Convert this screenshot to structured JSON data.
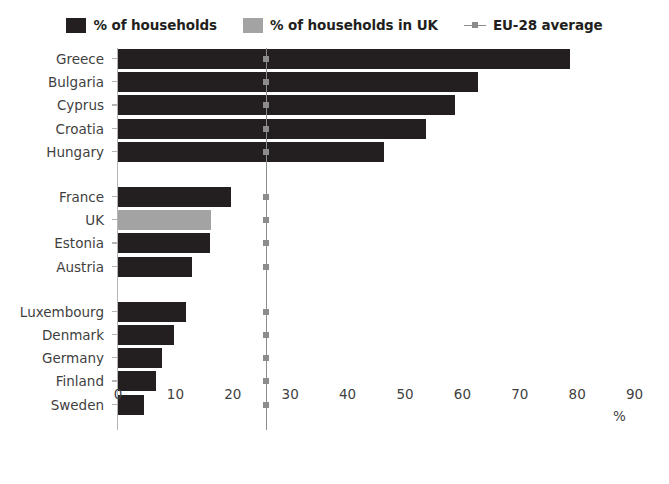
{
  "legend": {
    "items": [
      {
        "label": "% of households",
        "type": "swatch",
        "color": "#231f20",
        "icon": "square-swatch-icon"
      },
      {
        "label": "% of households in UK",
        "type": "swatch",
        "color": "#a3a3a3",
        "icon": "square-swatch-icon"
      },
      {
        "label": "EU-28 average",
        "type": "line",
        "color": "#8c8c8c",
        "icon": "line-marker-icon"
      }
    ]
  },
  "axis": {
    "x_unit": "%",
    "x_ticks": [
      "0",
      "10",
      "20",
      "30",
      "40",
      "50",
      "60",
      "70",
      "80",
      "90"
    ]
  },
  "chart_data": {
    "type": "bar",
    "orientation": "horizontal",
    "title": "",
    "xlabel": "%",
    "ylabel": "",
    "xlim": [
      0,
      90
    ],
    "grid": false,
    "legend_position": "top-center",
    "series": [
      {
        "name": "% of households",
        "color": "#231f20"
      },
      {
        "name": "% of households in UK",
        "color": "#a3a3a3"
      }
    ],
    "reference_line": {
      "name": "EU-28 average",
      "value": 25.7,
      "color": "#8c8c8c"
    },
    "groups": [
      {
        "name": "highest",
        "bars": [
          {
            "category": "Greece",
            "value": 78.8,
            "series": "% of households"
          },
          {
            "category": "Bulgaria",
            "value": 62.8,
            "series": "% of households"
          },
          {
            "category": "Cyprus",
            "value": 58.7,
            "series": "% of households"
          },
          {
            "category": "Croatia",
            "value": 53.6,
            "series": "% of households"
          },
          {
            "category": "Hungary",
            "value": 46.4,
            "series": "% of households"
          }
        ]
      },
      {
        "name": "middle",
        "bars": [
          {
            "category": "France",
            "value": 19.7,
            "series": "% of households"
          },
          {
            "category": "UK",
            "value": 16.2,
            "series": "% of households in UK"
          },
          {
            "category": "Estonia",
            "value": 16.0,
            "series": "% of households"
          },
          {
            "category": "Austria",
            "value": 12.9,
            "series": "% of households"
          }
        ]
      },
      {
        "name": "lowest",
        "bars": [
          {
            "category": "Luxembourg",
            "value": 11.8,
            "series": "% of households"
          },
          {
            "category": "Denmark",
            "value": 9.8,
            "series": "% of households"
          },
          {
            "category": "Germany",
            "value": 7.7,
            "series": "% of households"
          },
          {
            "category": "Finland",
            "value": 6.7,
            "series": "% of households"
          },
          {
            "category": "Sweden",
            "value": 4.6,
            "series": "% of households"
          }
        ]
      }
    ]
  }
}
